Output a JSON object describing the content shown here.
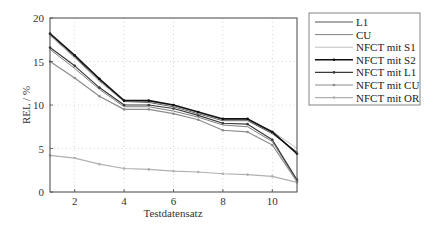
{
  "chart_data": {
    "type": "line",
    "title": "",
    "xlabel": "Testdatensatz",
    "ylabel": "REL / %",
    "xlim": [
      1,
      11
    ],
    "ylim": [
      0,
      20
    ],
    "xticks": [
      2,
      4,
      6,
      8,
      10
    ],
    "yticks": [
      0,
      5,
      10,
      15,
      20
    ],
    "grid": true,
    "legend_position": "outside-right-top",
    "x": [
      1,
      2,
      3,
      4,
      5,
      6,
      7,
      8,
      9,
      10,
      11
    ],
    "series": [
      {
        "name": "L1",
        "color": "#555555",
        "width": 1,
        "markers": false,
        "values": [
          18.0,
          15.5,
          12.8,
          10.4,
          10.3,
          9.8,
          9.0,
          8.2,
          8.2,
          6.7,
          4.6
        ]
      },
      {
        "name": "CU",
        "color": "#808080",
        "width": 1,
        "markers": false,
        "values": [
          16.4,
          14.2,
          11.8,
          9.8,
          9.8,
          9.3,
          8.6,
          7.7,
          7.5,
          5.8,
          1.3
        ]
      },
      {
        "name": "NFCT mit S1",
        "color": "#c0c0c0",
        "width": 1,
        "markers": false,
        "values": [
          18.0,
          15.4,
          12.7,
          10.4,
          10.4,
          9.9,
          9.1,
          8.3,
          8.3,
          7.0,
          5.0
        ]
      },
      {
        "name": "NFCT mit S2",
        "color": "#111111",
        "width": 1.6,
        "markers": true,
        "values": [
          18.2,
          15.7,
          13.0,
          10.5,
          10.5,
          10.0,
          9.2,
          8.4,
          8.4,
          6.9,
          4.4
        ]
      },
      {
        "name": "NFCT mit L1",
        "color": "#3a3a3a",
        "width": 1.2,
        "markers": true,
        "values": [
          16.6,
          14.5,
          12.0,
          10.0,
          10.0,
          9.6,
          8.8,
          7.9,
          7.8,
          6.0,
          1.4
        ]
      },
      {
        "name": "NFCT mit CU",
        "color": "#8c8c8c",
        "width": 1.2,
        "markers": true,
        "values": [
          15.0,
          13.1,
          11.0,
          9.5,
          9.5,
          9.0,
          8.3,
          7.1,
          6.9,
          5.4,
          1.2
        ]
      },
      {
        "name": "NFCT mit OR",
        "color": "#b0b0b0",
        "width": 1.2,
        "markers": true,
        "values": [
          4.2,
          3.9,
          3.2,
          2.7,
          2.6,
          2.4,
          2.3,
          2.1,
          2.0,
          1.8,
          1.1
        ]
      }
    ]
  }
}
